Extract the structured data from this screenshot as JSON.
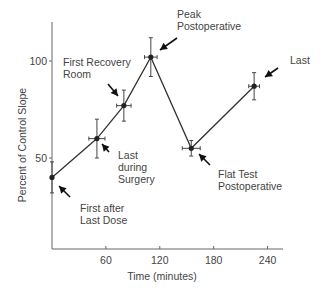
{
  "chart_data": {
    "type": "line",
    "title": "",
    "xlabel": "Time (minutes)",
    "ylabel": "Percent of Control Slope",
    "xlim": [
      0,
      270
    ],
    "ylim": [
      0,
      125
    ],
    "x_ticks": [
      60,
      120,
      180,
      240
    ],
    "y_ticks": [
      50,
      100
    ],
    "grid": false,
    "series": [
      {
        "name": "Control Slope",
        "points": [
          {
            "x": 0,
            "y": 40,
            "x_err": 0,
            "y_err": 8,
            "label": "First after Last Dose"
          },
          {
            "x": 50,
            "y": 60,
            "x_err": 9,
            "y_err": 10,
            "label": "Last during Surgery"
          },
          {
            "x": 80,
            "y": 77,
            "x_err": 8,
            "y_err": 8,
            "label": "First Recovery Room"
          },
          {
            "x": 110,
            "y": 102,
            "x_err": 7,
            "y_err": 10,
            "label": "Peak Postoperative"
          },
          {
            "x": 155,
            "y": 55,
            "x_err": 10,
            "y_err": 4,
            "label": "Flat Test Postoperative"
          },
          {
            "x": 225,
            "y": 87,
            "x_err": 6,
            "y_err": 7,
            "label": "Last"
          }
        ]
      }
    ],
    "annotations": [
      {
        "lines": [
          "Peak",
          "Postoperative"
        ],
        "target": 3
      },
      {
        "lines": [
          "First Recovery",
          "Room"
        ],
        "target": 2
      },
      {
        "lines": [
          "Last"
        ],
        "target": 5
      },
      {
        "lines": [
          "Last",
          "during",
          "Surgery"
        ],
        "target": 1
      },
      {
        "lines": [
          "Flat Test",
          "Postoperative"
        ],
        "target": 4
      },
      {
        "lines": [
          "First after",
          "Last Dose"
        ],
        "target": 0
      }
    ]
  }
}
